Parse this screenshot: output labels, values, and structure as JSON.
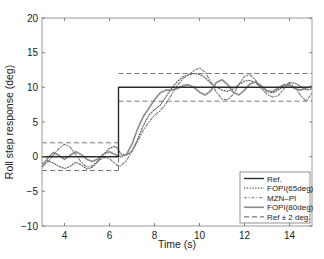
{
  "chart_data": {
    "type": "line",
    "title": "",
    "xlabel": "Time (s)",
    "ylabel": "Roll step response (deg)",
    "xlim": [
      3,
      15
    ],
    "ylim": [
      -10,
      20
    ],
    "xticks": [
      4,
      6,
      8,
      10,
      12,
      14
    ],
    "yticks": [
      -10,
      -5,
      0,
      5,
      10,
      15,
      20
    ],
    "xtick_labels": [
      "4",
      "6",
      "8",
      "10",
      "12",
      "14"
    ],
    "ytick_labels": [
      "−10",
      "−5",
      "0",
      "5",
      "10",
      "15",
      "20"
    ],
    "grid": false,
    "legend_position": "bottom-right",
    "x": [
      3.0,
      3.25,
      3.5,
      3.75,
      4.0,
      4.25,
      4.5,
      4.75,
      5.0,
      5.25,
      5.5,
      5.75,
      6.0,
      6.25,
      6.4,
      6.5,
      6.75,
      7.0,
      7.25,
      7.5,
      7.75,
      8.0,
      8.25,
      8.5,
      8.75,
      9.0,
      9.25,
      9.5,
      9.75,
      10.0,
      10.25,
      10.5,
      10.75,
      11.0,
      11.25,
      11.5,
      11.75,
      12.0,
      12.25,
      12.5,
      12.75,
      13.0,
      13.25,
      13.5,
      13.75,
      14.0,
      14.25,
      14.5,
      14.75,
      15.0
    ],
    "series": [
      {
        "name": "Ref.",
        "style": "solid",
        "color": "#2b2b2b",
        "values": [
          0,
          0,
          0,
          0,
          0,
          0,
          0,
          0,
          0,
          0,
          0,
          0,
          0,
          0,
          10,
          10,
          10,
          10,
          10,
          10,
          10,
          10,
          10,
          10,
          10,
          10,
          10,
          10,
          10,
          10,
          10,
          10,
          10,
          10,
          10,
          10,
          10,
          10,
          10,
          10,
          10,
          10,
          10,
          10,
          10,
          10,
          10,
          10,
          10,
          10
        ]
      },
      {
        "name": "FOPI(65deg)",
        "style": "dotted",
        "color": "#555555",
        "values": [
          -1.0,
          -0.6,
          -0.9,
          -1.4,
          -1.7,
          -1.4,
          -0.8,
          -1.2,
          -1.8,
          -1.5,
          -0.6,
          0.4,
          1.2,
          1.5,
          1.0,
          0.4,
          0.2,
          0.8,
          2.5,
          4.5,
          6.0,
          6.8,
          7.4,
          8.6,
          9.8,
          10.8,
          11.5,
          11.8,
          12.0,
          11.9,
          11.4,
          10.6,
          10.0,
          9.6,
          9.4,
          9.8,
          10.4,
          10.9,
          11.0,
          10.6,
          10.0,
          9.4,
          9.2,
          9.6,
          10.2,
          10.7,
          10.6,
          10.1,
          9.6,
          9.8
        ]
      },
      {
        "name": "MZN–PI",
        "style": "dashdot",
        "color": "#777777",
        "values": [
          -1.5,
          -0.8,
          0.2,
          1.2,
          1.8,
          1.4,
          0.3,
          -0.8,
          -1.5,
          -1.3,
          -0.6,
          -0.1,
          -0.3,
          -1.0,
          -1.4,
          -1.3,
          -0.6,
          0.8,
          2.2,
          3.8,
          5.0,
          6.0,
          6.6,
          7.6,
          8.9,
          10.2,
          11.2,
          11.8,
          12.4,
          12.8,
          12.2,
          10.8,
          9.3,
          8.3,
          8.2,
          9.0,
          10.4,
          11.6,
          11.8,
          11.0,
          9.8,
          9.0,
          8.6,
          8.8,
          9.8,
          10.6,
          10.0,
          8.8,
          8.0,
          9.2
        ]
      },
      {
        "name": "FOPI(80deg)",
        "style": "solid",
        "color": "#8a8a8a",
        "values": [
          -1.5,
          -0.2,
          0.6,
          0.2,
          -0.4,
          0.2,
          0.7,
          0.3,
          -0.4,
          -0.7,
          -0.3,
          0.4,
          0.7,
          0.3,
          0.1,
          0.0,
          0.3,
          1.8,
          4.0,
          5.8,
          7.0,
          8.2,
          9.2,
          9.6,
          9.6,
          9.8,
          10.2,
          10.4,
          10.0,
          9.3,
          8.9,
          9.5,
          10.7,
          11.1,
          10.4,
          9.3,
          8.9,
          9.6,
          10.5,
          10.8,
          10.2,
          9.5,
          9.4,
          9.9,
          10.4,
          10.3,
          9.8,
          9.6,
          9.9,
          10.2
        ]
      },
      {
        "name": "Ref ± 2 deg.",
        "style": "dashed",
        "color": "#777777",
        "upper": [
          2,
          2,
          2,
          2,
          2,
          2,
          2,
          2,
          2,
          2,
          2,
          2,
          2,
          2,
          12,
          12,
          12,
          12,
          12,
          12,
          12,
          12,
          12,
          12,
          12,
          12,
          12,
          12,
          12,
          12,
          12,
          12,
          12,
          12,
          12,
          12,
          12,
          12,
          12,
          12,
          12,
          12,
          12,
          12,
          12,
          12,
          12,
          12,
          12,
          12
        ],
        "lower": [
          -2,
          -2,
          -2,
          -2,
          -2,
          -2,
          -2,
          -2,
          -2,
          -2,
          -2,
          -2,
          -2,
          -2,
          8,
          8,
          8,
          8,
          8,
          8,
          8,
          8,
          8,
          8,
          8,
          8,
          8,
          8,
          8,
          8,
          8,
          8,
          8,
          8,
          8,
          8,
          8,
          8,
          8,
          8,
          8,
          8,
          8,
          8,
          8,
          8,
          8,
          8,
          8,
          8
        ]
      }
    ]
  }
}
